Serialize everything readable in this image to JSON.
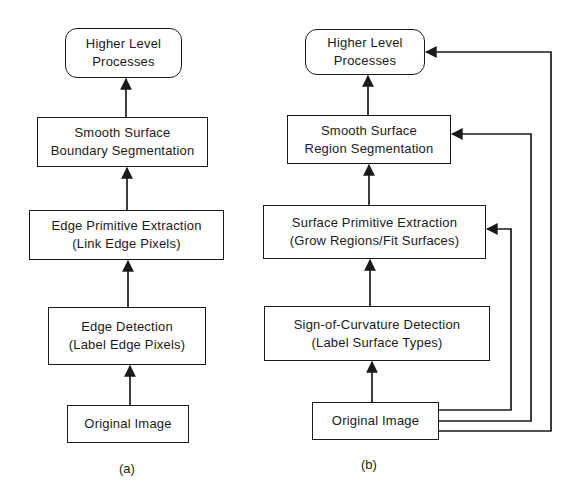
{
  "diagram": {
    "panel_a": {
      "caption": "(a)",
      "nodes": [
        {
          "id": "a_higher",
          "line1": "Higher Level",
          "line2": "Processes",
          "shape": "rounded"
        },
        {
          "id": "a_smooth",
          "line1": "Smooth Surface",
          "line2": "Boundary Segmentation",
          "shape": "rect"
        },
        {
          "id": "a_edge_prim",
          "line1": "Edge Primitive Extraction",
          "line2": "(Link Edge Pixels)",
          "shape": "rect"
        },
        {
          "id": "a_edge_det",
          "line1": "Edge Detection",
          "line2": "(Label Edge Pixels)",
          "shape": "rect"
        },
        {
          "id": "a_original",
          "line1": "Original Image",
          "shape": "rect"
        }
      ],
      "edges": [
        {
          "from": "a_original",
          "to": "a_edge_det"
        },
        {
          "from": "a_edge_det",
          "to": "a_edge_prim"
        },
        {
          "from": "a_edge_prim",
          "to": "a_smooth"
        },
        {
          "from": "a_smooth",
          "to": "a_higher"
        }
      ]
    },
    "panel_b": {
      "caption": "(b)",
      "nodes": [
        {
          "id": "b_higher",
          "line1": "Higher Level",
          "line2": "Processes",
          "shape": "rounded"
        },
        {
          "id": "b_smooth",
          "line1": "Smooth Surface",
          "line2": "Region Segmentation",
          "shape": "rect"
        },
        {
          "id": "b_surf_prim",
          "line1": "Surface Primitive Extraction",
          "line2": "(Grow Regions/Fit Surfaces)",
          "shape": "rect"
        },
        {
          "id": "b_sign",
          "line1": "Sign-of-Curvature Detection",
          "line2": "(Label Surface Types)",
          "shape": "rect"
        },
        {
          "id": "b_original",
          "line1": "Original Image",
          "shape": "rect"
        }
      ],
      "edges": [
        {
          "from": "b_original",
          "to": "b_sign"
        },
        {
          "from": "b_sign",
          "to": "b_surf_prim"
        },
        {
          "from": "b_surf_prim",
          "to": "b_smooth"
        },
        {
          "from": "b_smooth",
          "to": "b_higher"
        },
        {
          "from": "b_original",
          "to": "b_surf_prim",
          "type": "feedforward-bypass"
        },
        {
          "from": "b_original",
          "to": "b_smooth",
          "type": "feedforward-bypass"
        },
        {
          "from": "b_original",
          "to": "b_higher",
          "type": "feedforward-bypass"
        }
      ]
    },
    "colors": {
      "ink": "#1a1a1a",
      "background": "#ffffff"
    }
  }
}
